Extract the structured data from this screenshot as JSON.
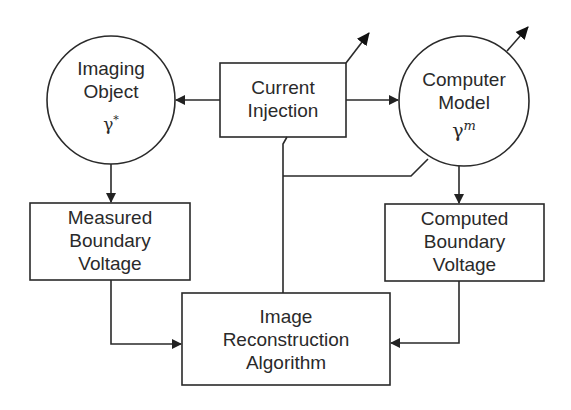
{
  "diagram": {
    "type": "flowchart",
    "nodes": [
      {
        "id": "imaging_object",
        "shape": "circle",
        "lines": [
          "Imaging",
          "Object"
        ],
        "symbol": "γ",
        "superscript": "*"
      },
      {
        "id": "current_injection",
        "shape": "rect",
        "lines": [
          "Current",
          "Injection"
        ]
      },
      {
        "id": "computer_model",
        "shape": "circle",
        "lines": [
          "Computer",
          "Model"
        ],
        "symbol": "γ",
        "superscript": "m"
      },
      {
        "id": "measured_voltage",
        "shape": "rect",
        "lines": [
          "Measured",
          "Boundary",
          "Voltage"
        ]
      },
      {
        "id": "computed_voltage",
        "shape": "rect",
        "lines": [
          "Computed",
          "Boundary",
          "Voltage"
        ]
      },
      {
        "id": "reconstruction",
        "shape": "rect",
        "lines": [
          "Image",
          "Reconstruction",
          "Algorithm"
        ]
      }
    ],
    "edges": [
      {
        "from": "current_injection",
        "to": "imaging_object"
      },
      {
        "from": "current_injection",
        "to": "computer_model"
      },
      {
        "from": "imaging_object",
        "to": "measured_voltage"
      },
      {
        "from": "computer_model",
        "to": "computed_voltage"
      },
      {
        "from": "measured_voltage",
        "to": "reconstruction"
      },
      {
        "from": "computed_voltage",
        "to": "reconstruction"
      },
      {
        "from": "reconstruction",
        "to": "current_injection",
        "style": "update-line"
      },
      {
        "from": "reconstruction",
        "to": "computer_model",
        "style": "update-line"
      }
    ],
    "stroke_color": "#2a2a2a",
    "background": "#ffffff"
  }
}
